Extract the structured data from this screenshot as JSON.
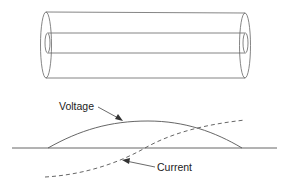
{
  "diagram": {
    "title": "",
    "components": {
      "cable": {
        "name": "coaxial-cylinder",
        "outer_conductor": {
          "x_left": 45,
          "x_right": 245,
          "y_top": 12,
          "y_bottom": 78
        },
        "inner_conductor": {
          "x_left": 47,
          "x_right": 245,
          "y_top": 33,
          "y_bottom": 53
        }
      },
      "waveforms": {
        "baseline": {
          "x1": 12,
          "x2": 277,
          "y": 148
        },
        "voltage": {
          "style": "solid",
          "shape": "half-sine arc above baseline"
        },
        "current": {
          "style": "dashed",
          "shape": "rising sine segment crossing baseline"
        }
      }
    },
    "labels": {
      "voltage": "Voltage",
      "current": "Current"
    },
    "colors": {
      "stroke": "#555555",
      "text": "#222222",
      "background": "#ffffff"
    }
  }
}
